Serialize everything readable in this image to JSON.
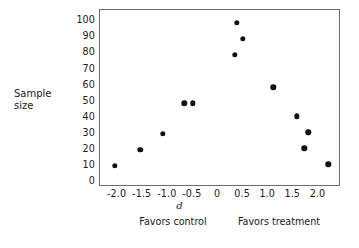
{
  "chart_data": {
    "type": "scatter",
    "title": "",
    "xlabel": "d",
    "ylabel": "Sample size",
    "xlim": [
      -2.35,
      2.45
    ],
    "ylim": [
      -3,
      107
    ],
    "grid": false,
    "legend": null,
    "xticks": [
      -2.0,
      -1.5,
      -1.0,
      -0.5,
      0,
      0.5,
      1.0,
      1.5,
      2.0
    ],
    "xticklabels": [
      "-2.0",
      "-1.5",
      "-1.0",
      "-0.5",
      "0",
      "0.5",
      "1.0",
      "1.5",
      "2.0"
    ],
    "yticks": [
      0,
      10,
      20,
      30,
      40,
      50,
      60,
      70,
      80,
      90,
      100
    ],
    "yticklabels": [
      "0",
      "10",
      "20",
      "30",
      "40",
      "50",
      "60",
      "70",
      "80",
      "90",
      "100"
    ],
    "points": [
      {
        "d": -2.05,
        "n": 10
      },
      {
        "d": -1.55,
        "n": 20
      },
      {
        "d": -1.1,
        "n": 30
      },
      {
        "d": -0.67,
        "n": 49
      },
      {
        "d": -0.5,
        "n": 49
      },
      {
        "d": 0.33,
        "n": 79
      },
      {
        "d": 0.37,
        "n": 99
      },
      {
        "d": 0.5,
        "n": 89
      },
      {
        "d": 1.1,
        "n": 59
      },
      {
        "d": 1.57,
        "n": 41
      },
      {
        "d": 1.72,
        "n": 21
      },
      {
        "d": 1.8,
        "n": 31
      },
      {
        "d": 2.2,
        "n": 11
      }
    ],
    "marker_color": "#111111",
    "frame_color": "#6e6e6e",
    "annotations": [
      {
        "name": "favors-control",
        "text": "Favors control"
      },
      {
        "name": "favors-treatment",
        "text": "Favors treatment"
      }
    ]
  },
  "axis_titles": {
    "y_line1": "Sample",
    "y_line2": "size",
    "x": "d"
  }
}
